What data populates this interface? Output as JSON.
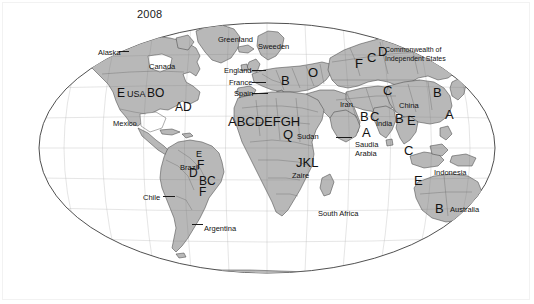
{
  "figure": {
    "title": "2008",
    "projection": "winkel-tripel",
    "land_fill": "#b8b8b8",
    "land_stroke": "#4a4a4a",
    "ocean_fill": "#ffffff",
    "graticule_stroke": "#5a5a5a",
    "label_color": "#111111"
  },
  "country_labels": [
    {
      "text": "Alaska",
      "x": 98,
      "y": 49
    },
    {
      "text": "Canada",
      "x": 149,
      "y": 63
    },
    {
      "text": "Greenland",
      "x": 218,
      "y": 36
    },
    {
      "text": "Sweeden",
      "x": 258,
      "y": 43
    },
    {
      "text": "England",
      "x": 224,
      "y": 67
    },
    {
      "text": "France",
      "x": 229,
      "y": 79
    },
    {
      "text": "Spain",
      "x": 234,
      "y": 90
    },
    {
      "text": "Mexico",
      "x": 113,
      "y": 120
    },
    {
      "text": "Brazil",
      "x": 180,
      "y": 164
    },
    {
      "text": "Chile",
      "x": 143,
      "y": 194
    },
    {
      "text": "Argentina",
      "x": 204,
      "y": 225
    },
    {
      "text": "Sudan",
      "x": 297,
      "y": 133
    },
    {
      "text": "Zaire",
      "x": 292,
      "y": 172
    },
    {
      "text": "South Africa",
      "x": 318,
      "y": 210
    },
    {
      "text": "Saudia",
      "x": 355,
      "y": 141
    },
    {
      "text": "Arabia",
      "x": 355,
      "y": 150
    },
    {
      "text": "Iran",
      "x": 340,
      "y": 101
    },
    {
      "text": "China",
      "x": 399,
      "y": 102
    },
    {
      "text": "India",
      "x": 376,
      "y": 120
    },
    {
      "text": "Indonesia",
      "x": 434,
      "y": 169
    },
    {
      "text": "Australia",
      "x": 450,
      "y": 206
    }
  ],
  "region_notes": [
    {
      "line1": "Commonwealth of",
      "line2": "Independent States",
      "x": 385,
      "y": 46
    }
  ],
  "codes": [
    {
      "text": "E",
      "x": 117,
      "y": 87,
      "size": "code"
    },
    {
      "text": "USA",
      "x": 127,
      "y": 90,
      "size": "code-sm"
    },
    {
      "text": "BO",
      "x": 147,
      "y": 87,
      "size": "code"
    },
    {
      "text": "AD",
      "x": 175,
      "y": 101,
      "size": "code"
    },
    {
      "text": "E",
      "x": 196,
      "y": 150,
      "size": "code-sm"
    },
    {
      "text": "F",
      "x": 197,
      "y": 159,
      "size": "code"
    },
    {
      "text": "D",
      "x": 189,
      "y": 167,
      "size": "code"
    },
    {
      "text": "BC",
      "x": 199,
      "y": 175,
      "size": "code"
    },
    {
      "text": "F",
      "x": 199,
      "y": 186,
      "size": "code"
    },
    {
      "text": "B",
      "x": 281,
      "y": 74,
      "size": "code-lg"
    },
    {
      "text": "O",
      "x": 308,
      "y": 66,
      "size": "code-lg"
    },
    {
      "text": "F",
      "x": 355,
      "y": 57,
      "size": "code-lg"
    },
    {
      "text": "C",
      "x": 367,
      "y": 51,
      "size": "code-lg"
    },
    {
      "text": "D",
      "x": 378,
      "y": 45,
      "size": "code-lg"
    },
    {
      "text": "ABCDEFGH",
      "x": 228,
      "y": 115,
      "size": "code-lg"
    },
    {
      "text": "Q",
      "x": 283,
      "y": 128,
      "size": "code-lg"
    },
    {
      "text": "JKL",
      "x": 296,
      "y": 156,
      "size": "code-lg"
    },
    {
      "text": "C",
      "x": 383,
      "y": 84,
      "size": "code-lg"
    },
    {
      "text": "B",
      "x": 433,
      "y": 86,
      "size": "code-lg"
    },
    {
      "text": "A",
      "x": 445,
      "y": 108,
      "size": "code-lg"
    },
    {
      "text": "B",
      "x": 360,
      "y": 110,
      "size": "code-lg"
    },
    {
      "text": "C",
      "x": 370,
      "y": 110,
      "size": "code-lg"
    },
    {
      "text": "A",
      "x": 362,
      "y": 126,
      "size": "code-lg"
    },
    {
      "text": "B",
      "x": 395,
      "y": 112,
      "size": "code-lg"
    },
    {
      "text": "E",
      "x": 407,
      "y": 114,
      "size": "code-lg"
    },
    {
      "text": "C",
      "x": 404,
      "y": 144,
      "size": "code-lg"
    },
    {
      "text": "E",
      "x": 414,
      "y": 174,
      "size": "code-lg"
    },
    {
      "text": "B",
      "x": 435,
      "y": 202,
      "size": "code-lg"
    }
  ],
  "leader_lines": [
    {
      "x": 119,
      "y": 51,
      "width": 10
    },
    {
      "x": 252,
      "y": 70,
      "width": 14
    },
    {
      "x": 252,
      "y": 82,
      "width": 14
    },
    {
      "x": 252,
      "y": 93,
      "width": 16
    },
    {
      "x": 336,
      "y": 137,
      "width": 16
    },
    {
      "x": 163,
      "y": 196,
      "width": 12
    },
    {
      "x": 192,
      "y": 224,
      "width": 11
    }
  ]
}
